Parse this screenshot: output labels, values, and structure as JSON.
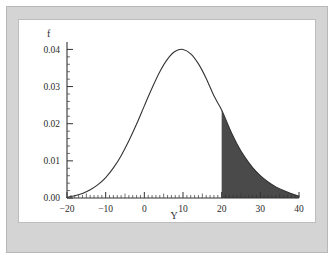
{
  "figure": {
    "frame_color": "#d4d4d4",
    "plot_background": "#ffffff",
    "curve_color": "#333333",
    "shade_color": "#4a4a4a",
    "axis_color": "#333333"
  },
  "chart_data": {
    "type": "line",
    "title": "",
    "subtitle": "",
    "xlabel": "Y",
    "ylabel": "f",
    "xlim": [
      -20,
      40
    ],
    "ylim": [
      0.0,
      0.042
    ],
    "grid": false,
    "legend": null,
    "x_ticks": [
      -20,
      -10,
      0,
      10,
      20,
      30,
      40
    ],
    "x_tick_labels": [
      "-20",
      "-10",
      "0",
      "10",
      "20",
      "30",
      "40"
    ],
    "x_minor_tick_step": 1,
    "y_ticks": [
      0.0,
      0.01,
      0.02,
      0.03,
      0.04
    ],
    "y_tick_labels": [
      "0.00",
      "0.01",
      "0.02",
      "0.03",
      "0.04"
    ],
    "y_minor_tick_step": 0.002,
    "annotations": [
      {
        "name": "shaded-right-tail",
        "type": "area-fill",
        "x_from": 20,
        "x_to": 40,
        "color": "#4a4a4a",
        "label": ""
      }
    ],
    "series": [
      {
        "name": "density",
        "description": "right-skewed probability density f(Y), peak approximately 0.0400 near Y = 10",
        "x": [
          -20,
          -18,
          -16,
          -14,
          -12,
          -10,
          -8,
          -6,
          -4,
          -2,
          0,
          2,
          4,
          6,
          8,
          10,
          12,
          14,
          16,
          18,
          20,
          22,
          24,
          26,
          28,
          30,
          32,
          34,
          36,
          38,
          40
        ],
        "values": [
          0.0002,
          0.0006,
          0.0012,
          0.0022,
          0.0036,
          0.0055,
          0.0081,
          0.0114,
          0.0154,
          0.0199,
          0.0248,
          0.0296,
          0.034,
          0.0374,
          0.0395,
          0.04,
          0.0388,
          0.0361,
          0.0322,
          0.0275,
          0.0237,
          0.0188,
          0.0145,
          0.011,
          0.0082,
          0.006,
          0.0043,
          0.003,
          0.002,
          0.0012,
          0.0005
        ]
      }
    ]
  },
  "labels": {
    "y_axis_title": "f",
    "x_axis_title": "Y",
    "x_tick_0": "-20",
    "x_tick_1": "-10",
    "x_tick_2": "0",
    "x_tick_3": "10",
    "x_tick_4": "20",
    "x_tick_5": "30",
    "x_tick_6": "40",
    "y_tick_0": "0.00",
    "y_tick_1": "0.01",
    "y_tick_2": "0.02",
    "y_tick_3": "0.03",
    "y_tick_4": "0.04"
  }
}
